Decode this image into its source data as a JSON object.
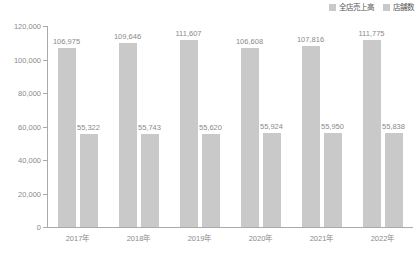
{
  "chart_data": {
    "type": "bar",
    "title": "",
    "subtitle": "",
    "xlabel": "",
    "ylabel": "",
    "ylim": [
      0,
      120000
    ],
    "grid": false,
    "legend_position": "top-right",
    "categories": [
      "2017年",
      "2018年",
      "2019年",
      "2020年",
      "2021年",
      "2022年"
    ],
    "ytick_labels": [
      "0",
      "20,000",
      "40,000",
      "60,000",
      "80,000",
      "100,000",
      "120,000"
    ],
    "ytick_values": [
      0,
      20000,
      40000,
      60000,
      80000,
      100000,
      120000
    ],
    "series": [
      {
        "name": "全店売上高",
        "color": "#c9c9c9",
        "values": [
          106975,
          109646,
          111607,
          106608,
          107816,
          111775
        ],
        "value_labels": [
          "106,975",
          "109,646",
          "111,607",
          "106,608",
          "107,816",
          "111,775"
        ]
      },
      {
        "name": "店舗数",
        "color": "#c9c9c9",
        "values": [
          55322,
          55743,
          55620,
          55924,
          55950,
          55838
        ],
        "value_labels": [
          "55,322",
          "55,743",
          "55,620",
          "55,924",
          "55,950",
          "55,838"
        ]
      }
    ]
  },
  "colors": {
    "bar": "#c9c9c9",
    "axis": "#aaaaaa",
    "text": "#8a8a8a",
    "legend_text": "#555555",
    "background": "#ffffff"
  }
}
